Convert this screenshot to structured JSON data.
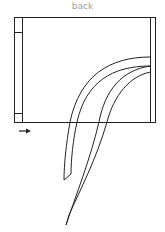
{
  "diagram": {
    "title": "back",
    "colors": {
      "stroke": "#222222",
      "label": "#a0a0a0",
      "background": "#ffffff"
    },
    "elements": [
      {
        "name": "frame",
        "type": "rectangle"
      },
      {
        "name": "left-rail",
        "type": "rectangle"
      },
      {
        "name": "top-left-block",
        "type": "square"
      },
      {
        "name": "bottom-left-block",
        "type": "square"
      },
      {
        "name": "right-rail",
        "type": "line"
      },
      {
        "name": "ribbon-short",
        "type": "curved-strip"
      },
      {
        "name": "ribbon-long",
        "type": "curved-strip"
      },
      {
        "name": "direction-arrow",
        "type": "arrow",
        "direction": "right"
      }
    ]
  }
}
